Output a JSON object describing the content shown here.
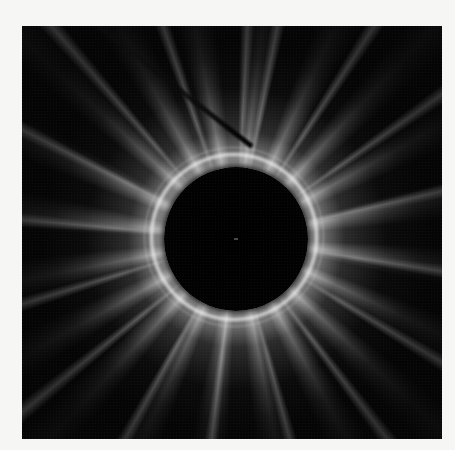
{
  "image": {
    "subject": "Radial diffraction pattern with dark central disk, bright ring and radiating streaks",
    "alt": "X-ray diffraction style pattern",
    "colors": {
      "background": "#f6f6f4",
      "frame": "#050505",
      "highlight": "#ffffff"
    },
    "elements": {
      "central_disk": "dark circular beam area",
      "bright_ring": "bright halo ring around disk",
      "streaks": "radiating streaks",
      "beam_stop": "diagonal beam stop shadow (upper left)"
    }
  }
}
